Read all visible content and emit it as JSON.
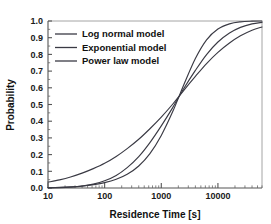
{
  "chart_data": {
    "type": "line",
    "title": "",
    "xlabel": "Residence Time [s]",
    "ylabel": "Probability",
    "xscale": "log",
    "yscale": "linear",
    "xlim": [
      10,
      60000
    ],
    "ylim": [
      0.0,
      1.0
    ],
    "grid": false,
    "legend_position": "top-left",
    "xticks": [
      10,
      100,
      1000,
      10000
    ],
    "xtick_labels": [
      "10",
      "100",
      "1000",
      "10000"
    ],
    "yticks": [
      0.0,
      0.1,
      0.2,
      0.3,
      0.4,
      0.5,
      0.6,
      0.7,
      0.8,
      0.9,
      1.0
    ],
    "ytick_labels": [
      "0.0",
      "0.1",
      "0.2",
      "0.3",
      "0.4",
      "0.5",
      "0.6",
      "0.7",
      "0.8",
      "0.9",
      "1.0"
    ],
    "series": [
      {
        "name": "Log normal model",
        "color": "#3a3a44",
        "x": [
          10,
          16,
          25,
          40,
          63,
          100,
          160,
          250,
          400,
          630,
          1000,
          1600,
          2500,
          4000,
          6300,
          10000,
          16000,
          25000,
          40000,
          60000
        ],
        "y": [
          0.001,
          0.002,
          0.005,
          0.011,
          0.023,
          0.043,
          0.075,
          0.122,
          0.188,
          0.272,
          0.372,
          0.483,
          0.596,
          0.704,
          0.799,
          0.874,
          0.928,
          0.962,
          0.983,
          0.992
        ]
      },
      {
        "name": "Exponential model",
        "color": "#3a3a44",
        "x": [
          10,
          16,
          25,
          40,
          63,
          100,
          160,
          250,
          400,
          630,
          1000,
          1600,
          2500,
          4000,
          6300,
          10000,
          16000,
          25000,
          40000,
          60000
        ],
        "y": [
          0.002,
          0.004,
          0.007,
          0.012,
          0.02,
          0.032,
          0.052,
          0.082,
          0.132,
          0.206,
          0.315,
          0.459,
          0.618,
          0.775,
          0.887,
          0.952,
          0.983,
          0.995,
          0.999,
          1.0
        ]
      },
      {
        "name": "Power law model",
        "color": "#3a3a44",
        "x": [
          10,
          16,
          25,
          40,
          63,
          100,
          160,
          250,
          400,
          630,
          1000,
          1600,
          2500,
          4000,
          6300,
          10000,
          16000,
          25000,
          40000,
          60000
        ],
        "y": [
          0.035,
          0.049,
          0.066,
          0.089,
          0.116,
          0.148,
          0.189,
          0.236,
          0.292,
          0.355,
          0.425,
          0.503,
          0.585,
          0.668,
          0.745,
          0.812,
          0.868,
          0.911,
          0.945,
          0.964
        ]
      }
    ]
  },
  "legend": {
    "items": [
      {
        "label": "Log normal model"
      },
      {
        "label": "Exponential model"
      },
      {
        "label": "Power law model"
      }
    ]
  },
  "axes": {
    "x_title": "Residence Time [s]",
    "y_title": "Probability"
  }
}
